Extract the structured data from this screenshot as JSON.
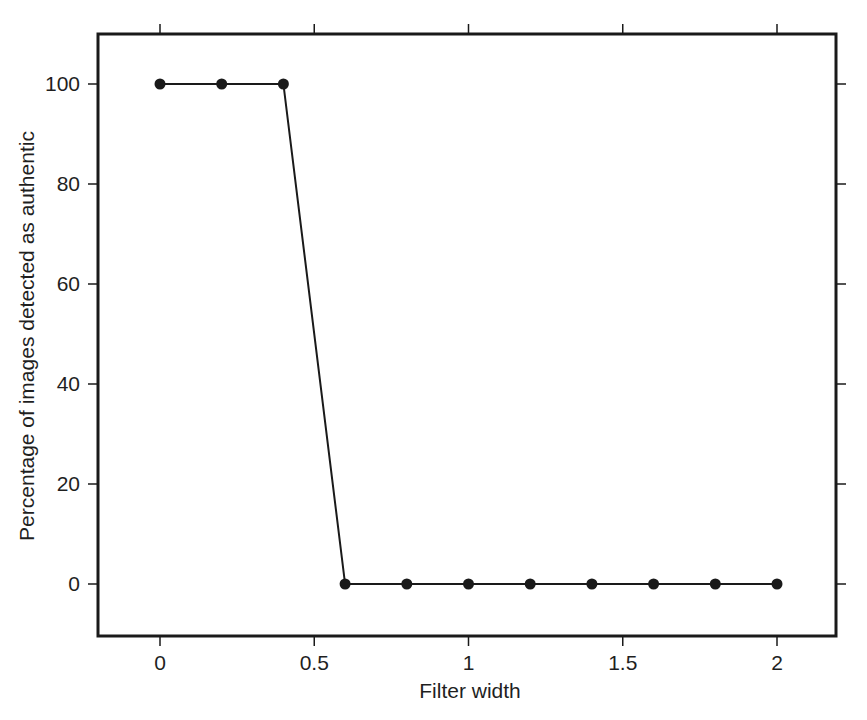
{
  "chart_data": {
    "type": "line",
    "title": "",
    "xlabel": "Filter width",
    "ylabel": "Percentage of images detected as authentic",
    "x": [
      0,
      0.2,
      0.4,
      0.6,
      0.8,
      1.0,
      1.2,
      1.4,
      1.6,
      1.8,
      2.0
    ],
    "series": [
      {
        "name": "Detected as authentic (%)",
        "values": [
          100,
          100,
          100,
          0,
          0,
          0,
          0,
          0,
          0,
          0,
          0
        ],
        "marker": "filled-circle",
        "color": "#1a1a1a"
      }
    ],
    "xlim": [
      -0.2,
      2.2
    ],
    "ylim": [
      -10,
      110
    ],
    "xticks": [
      0,
      0.5,
      1,
      1.5,
      2
    ],
    "xtick_labels": [
      "0",
      "0.5",
      "1",
      "1.5",
      "2"
    ],
    "yticks": [
      0,
      20,
      40,
      60,
      80,
      100
    ],
    "ytick_labels": [
      "0",
      "20",
      "40",
      "60",
      "80",
      "100"
    ],
    "grid": false,
    "legend": null,
    "frame": "boxed, ticks outward on all four sides"
  },
  "colors": {
    "background": "#ffffff",
    "ink": "#1a1a1a"
  }
}
